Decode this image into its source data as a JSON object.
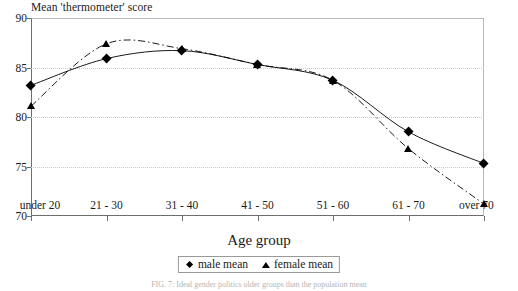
{
  "chart_data": {
    "type": "line",
    "title": "Mean 'thermometer' score",
    "xlabel": "Age group",
    "ylabel": "Mean 'thermometer' score",
    "categories": [
      "under 20",
      "21 - 30",
      "31 - 40",
      "41 - 50",
      "51 - 60",
      "61 - 70",
      "over 70"
    ],
    "ylim": [
      70,
      90
    ],
    "yticks": [
      70,
      75,
      80,
      85,
      90
    ],
    "ytick_labels": [
      "70",
      "75",
      "80",
      "85",
      "90"
    ],
    "grid": true,
    "legend_position": "bottom-center",
    "series": [
      {
        "name": "male mean",
        "marker": "diamond",
        "line_style": "solid",
        "color": "#000000",
        "values": [
          83.2,
          85.9,
          86.7,
          85.3,
          83.7,
          78.5,
          75.3
        ]
      },
      {
        "name": "female mean",
        "marker": "triangle",
        "line_style": "dash-dot",
        "color": "#000000",
        "values": [
          81.1,
          87.4,
          86.9,
          85.3,
          83.7,
          76.8,
          71.2
        ]
      }
    ]
  },
  "legend": {
    "items": [
      {
        "label": "male mean",
        "marker": "diamond-marker-icon"
      },
      {
        "label": "female mean",
        "marker": "triangle-marker-icon"
      }
    ]
  },
  "caption": {
    "text": "FIG. 7: Ideal gender politics older groups than the population mean"
  }
}
